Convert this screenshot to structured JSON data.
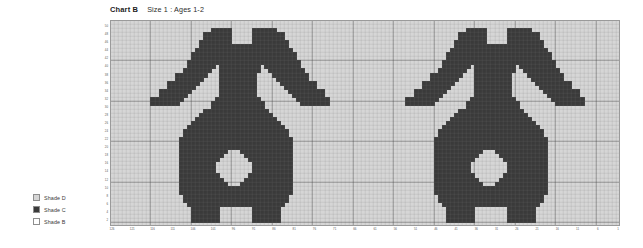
{
  "header": {
    "chart_label": "Chart B",
    "size_label": "Size 1 : Ages 1-2"
  },
  "legend": {
    "items": [
      {
        "label": "Shade D",
        "color": "#d6d6d6",
        "swatch": "light-swatch"
      },
      {
        "label": "Shade C",
        "color": "#3a3a3a",
        "swatch": "dark-swatch"
      },
      {
        "label": "Shade B",
        "color": "#ffffff",
        "swatch": "empty-swatch"
      }
    ]
  },
  "chart_data": {
    "type": "heatmap",
    "title": "Chart B",
    "subtitle": "Size 1 : Ages 1-2",
    "xlabel": "",
    "ylabel": "",
    "grid": true,
    "legend_position": "left",
    "cols": 126,
    "rows": 51,
    "cell_px": 4.05,
    "colors": {
      "background": "#d6d6d6",
      "filled": "#3a3a3a",
      "empty": "#f2f2f2",
      "gridline_minor": "#c2c2c2",
      "gridline_major": "#8c8c8c",
      "border": "#9a9a9a"
    },
    "major_every": 10,
    "x_tick_labels": [
      "126",
      "121",
      "116",
      "111",
      "106",
      "101",
      "96",
      "91",
      "86",
      "81",
      "76",
      "71",
      "66",
      "61",
      "56",
      "51",
      "46",
      "41",
      "36",
      "31",
      "26",
      "21",
      "16",
      "11",
      "6",
      "1"
    ],
    "x_tick_step": 5,
    "y_tick_labels": [
      "50",
      "48",
      "46",
      "44",
      "42",
      "40",
      "38",
      "36",
      "34",
      "32",
      "30",
      "28",
      "26",
      "24",
      "22",
      "20",
      "18",
      "16",
      "14",
      "12",
      "10",
      "8",
      "6",
      "4",
      "2"
    ],
    "y_tick_step": 2,
    "xlim": [
      1,
      126
    ],
    "ylim": [
      1,
      51
    ],
    "motif_name": "animal-motif",
    "motif_repeats": 2,
    "motif_origins_col": [
      9,
      72
    ],
    "motif_width": 45,
    "motif_height": 50,
    "motif_rows": [
      "000000000000000000000000000000000000000000000",
      "000000000000000000000000000000000000000000000",
      "000000000000000011111000001111110000000000000",
      "000000000000001111111000001111111100000000000",
      "000000000000001111111000001111111100000000000",
      "000000000000011111111000001111111110000000000",
      "000000000000011111111111111111111110000000000",
      "000000000000111111111111111111111111000000000",
      "000000000001111111111111111111111111100000000",
      "000000000001111111111111111111111111100000000",
      "000000000011111111111111111111111111110000000",
      "000000000011111110111111111101111111110000000",
      "000000000111111100111111111100111111111000000",
      "000000011111111000111111111000011111111100000",
      "000000011111110000111111111000001111111100000",
      "000001111111100000111111111000000111111111000",
      "000001111111000000111111111000000011111111000",
      "000111111110000000111111111000000001111111110",
      "000111111100000000111111111000000000111111110",
      "011111111000000001111111111100000000011111111",
      "011111110000000011111111111110000000001111111",
      "000000000000000011111111111110000000000000000",
      "000000000000001111111111111111000000000000000",
      "000000000000011111111111111111100000000000000",
      "000000000000111111111111111111110000000000000",
      "000000000001111111111111111111111000000000000",
      "000000000011111111111111111111111100000000000",
      "000000000111111111111111111111111110000000000",
      "000000000111111111111111111111111110000000000",
      "000000001111111111111111111111111111000000000",
      "000000001111111111111111111111111111000000000",
      "000000001111111111111111111111111111000000000",
      "000000001111111111110001111111111111000000000",
      "000000001111111111100000111111111111000000000",
      "000000001111111111000000011111111111000000000",
      "000000001111111110000000001111111111000000000",
      "000000001111111110000000001111111111000000000",
      "000000001111111110000000001111111111000000000",
      "000000001111111111000000011111111111000000000",
      "000000001111111111100000111111111111000000000",
      "000000001111111111110001111111111111000000000",
      "000000001111111111111111111111111111000000000",
      "000000001111111111111111111111111111000000000",
      "000000000111111111111111111111111110000000000",
      "000000000111111111111111111111111110000000000",
      "000000000011111111111111111111111100000000000",
      "000000000001111111000000001111111000000000000",
      "000000000001111111000000001111111000000000000",
      "000000000001111111000000001111111000000000000",
      "000000000001111111000000001111111000000000000"
    ]
  }
}
